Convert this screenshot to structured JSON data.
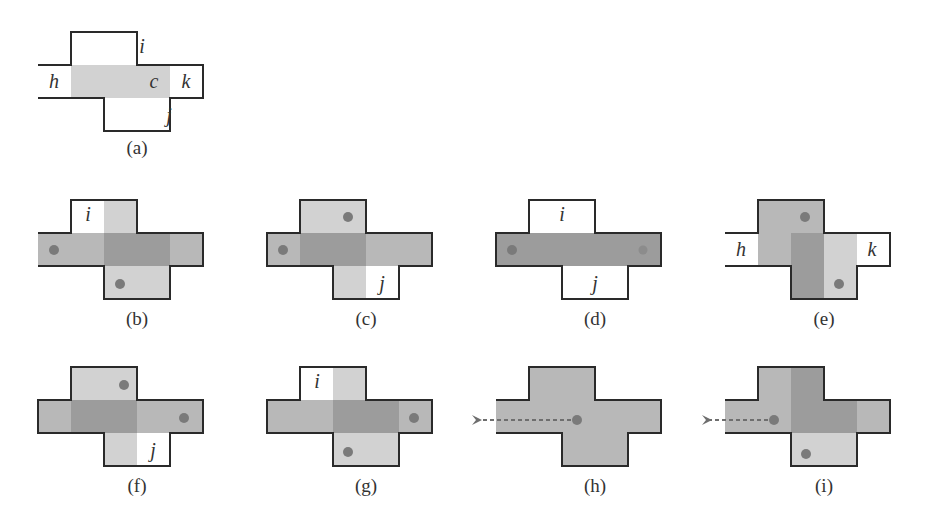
{
  "colors": {
    "white": "#ffffff",
    "light": "#d2d2d2",
    "medium": "#b8b8b8",
    "dark": "#9c9c9c",
    "dot": "#7a7a7a",
    "border": "#2a2a2a",
    "arrow": "#6e6e6e"
  },
  "cell_size": 33,
  "panels": [
    {
      "id": "a",
      "caption": "(a)",
      "x0": 38,
      "y0": 32,
      "open_left": true,
      "cells": {
        "top_l": "white",
        "top_r": "white",
        "mid_0": "white",
        "mid_1": "light",
        "mid_2": "light",
        "mid_3": "light",
        "mid_4": "white",
        "bot_l": "light",
        "bot_r": "white"
      },
      "cells_override": {
        "bot_l": "white",
        "bot_r": "white",
        "mid_0": "white"
      },
      "labels": [
        {
          "text": "i",
          "cx": 104,
          "cy": 15
        },
        {
          "text": "h",
          "cx": 16,
          "cy": 50
        },
        {
          "text": "c",
          "cx": 116,
          "cy": 50
        },
        {
          "text": "k",
          "cx": 148,
          "cy": 50
        },
        {
          "text": "j",
          "cx": 131,
          "cy": 84
        }
      ],
      "dots": [],
      "arrow": null
    },
    {
      "id": "b",
      "caption": "(b)",
      "x0": 38,
      "y0": 200,
      "open_left": true,
      "cells": {
        "top_l": "white",
        "top_r": "light",
        "mid_0": "medium",
        "mid_1": "medium",
        "mid_2": "dark",
        "mid_3": "dark",
        "mid_4": "medium",
        "bot_l": "light",
        "bot_r": "light"
      },
      "labels": [
        {
          "text": "i",
          "cx": 50,
          "cy": 15
        }
      ],
      "dots": [
        {
          "cx": 16,
          "cy": 50
        },
        {
          "cx": 82,
          "cy": 84
        }
      ],
      "arrow": null
    },
    {
      "id": "c",
      "caption": "(c)",
      "x0": 267,
      "y0": 200,
      "open_left": false,
      "cells": {
        "top_l": "light",
        "top_r": "light",
        "mid_0": "medium",
        "mid_1": "dark",
        "mid_2": "dark",
        "mid_3": "medium",
        "mid_4": "medium",
        "bot_l": "light",
        "bot_r": "white"
      },
      "labels": [
        {
          "text": "j",
          "cx": 115,
          "cy": 84
        }
      ],
      "dots": [
        {
          "cx": 81,
          "cy": 17
        },
        {
          "cx": 16,
          "cy": 50
        }
      ],
      "arrow": null
    },
    {
      "id": "d",
      "caption": "(d)",
      "x0": 496,
      "y0": 200,
      "open_left": false,
      "cells": {
        "top_l": "white",
        "top_r": "white",
        "mid_0": "dark",
        "mid_1": "dark",
        "mid_2": "dark",
        "mid_3": "dark",
        "mid_4": "dark",
        "bot_l": "white",
        "bot_r": "white"
      },
      "labels": [
        {
          "text": "i",
          "cx": 66,
          "cy": 15
        },
        {
          "text": "j",
          "cx": 99,
          "cy": 84
        }
      ],
      "dots": [
        {
          "cx": 16,
          "cy": 50
        },
        {
          "cx": 147,
          "cy": 50,
          "light": true
        }
      ],
      "arrow": null
    },
    {
      "id": "e",
      "caption": "(e)",
      "x0": 725,
      "y0": 200,
      "open_left": true,
      "cells": {
        "top_l": "medium",
        "top_r": "medium",
        "mid_0": "white",
        "mid_1": "medium",
        "mid_2": "dark",
        "mid_3": "light",
        "mid_4": "white",
        "bot_l": "dark",
        "bot_r": "light"
      },
      "labels": [
        {
          "text": "h",
          "cx": 16,
          "cy": 50
        },
        {
          "text": "k",
          "cx": 147,
          "cy": 50
        }
      ],
      "dots": [
        {
          "cx": 80,
          "cy": 17
        },
        {
          "cx": 114,
          "cy": 84
        }
      ],
      "arrow": null
    },
    {
      "id": "f",
      "caption": "(f)",
      "x0": 38,
      "y0": 367,
      "open_left": false,
      "cells": {
        "top_l": "light",
        "top_r": "light",
        "mid_0": "medium",
        "mid_1": "dark",
        "mid_2": "dark",
        "mid_3": "medium",
        "mid_4": "medium",
        "bot_l": "light",
        "bot_r": "white"
      },
      "labels": [
        {
          "text": "j",
          "cx": 115,
          "cy": 84
        }
      ],
      "dots": [
        {
          "cx": 86,
          "cy": 18
        },
        {
          "cx": 146,
          "cy": 51
        }
      ],
      "arrow": null
    },
    {
      "id": "g",
      "caption": "(g)",
      "x0": 267,
      "y0": 367,
      "open_left": false,
      "cells": {
        "top_l": "white",
        "top_r": "light",
        "mid_0": "medium",
        "mid_1": "medium",
        "mid_2": "dark",
        "mid_3": "dark",
        "mid_4": "medium",
        "bot_l": "light",
        "bot_r": "light"
      },
      "labels": [
        {
          "text": "i",
          "cx": 50,
          "cy": 15
        }
      ],
      "dots": [
        {
          "cx": 147,
          "cy": 51
        },
        {
          "cx": 81,
          "cy": 85
        }
      ],
      "arrow": null
    },
    {
      "id": "h",
      "caption": "(h)",
      "x0": 496,
      "y0": 367,
      "open_left": true,
      "cells": {
        "top_l": "medium",
        "top_r": "medium",
        "mid_0": "medium",
        "mid_1": "medium",
        "mid_2": "medium",
        "mid_3": "medium",
        "mid_4": "medium",
        "bot_l": "medium",
        "bot_r": "medium"
      },
      "labels": [],
      "dots": [
        {
          "cx": 81,
          "cy": 53
        }
      ],
      "arrow": {
        "from_x": 75,
        "to_x": -24,
        "y": 53
      }
    },
    {
      "id": "i",
      "caption": "(i)",
      "x0": 725,
      "y0": 367,
      "open_left": true,
      "cells": {
        "top_l": "medium",
        "top_r": "dark",
        "mid_0": "medium",
        "mid_1": "medium",
        "mid_2": "dark",
        "mid_3": "dark",
        "mid_4": "medium",
        "bot_l": "light",
        "bot_r": "light"
      },
      "labels": [],
      "dots": [
        {
          "cx": 49,
          "cy": 53
        },
        {
          "cx": 81,
          "cy": 87
        }
      ],
      "arrow": {
        "from_x": 43,
        "to_x": -23,
        "y": 53
      }
    }
  ]
}
